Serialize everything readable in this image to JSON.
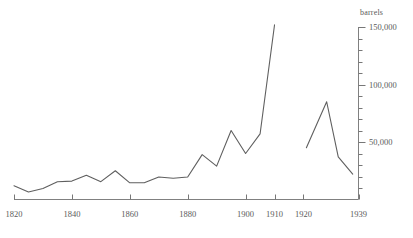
{
  "chart_data": {
    "type": "line",
    "title": "",
    "subtitle": "",
    "xlabel": "",
    "ylabel": "barrels",
    "ylabel_position": "top-right",
    "axis_position": {
      "y_axis": "right",
      "x_axis": "bottom"
    },
    "grid": false,
    "legend": null,
    "xlim": [
      1820,
      1939
    ],
    "ylim": [
      0,
      150000
    ],
    "ytick_major_values": [
      50000,
      100000,
      150000
    ],
    "ytick_major_labels": [
      "50,000",
      "100,000",
      "150,000"
    ],
    "ytick_minor_step": 10000,
    "xtick_values": [
      1820,
      1840,
      1860,
      1880,
      1900,
      1910,
      1920,
      1939
    ],
    "xtick_labels": [
      "1820",
      "1840",
      "1860",
      "1880",
      "1900",
      "1910",
      "1920",
      "1939"
    ],
    "series": [
      {
        "name": "pre-war",
        "color": "#5f5f5f",
        "x": [
          1820,
          1825,
          1830,
          1835,
          1840,
          1845,
          1850,
          1855,
          1860,
          1865,
          1870,
          1875,
          1880,
          1885,
          1890,
          1895,
          1900,
          1905,
          1910
        ],
        "values": [
          12000,
          6500,
          9500,
          15500,
          16000,
          21000,
          15500,
          25000,
          14500,
          14500,
          19500,
          18500,
          19500,
          39000,
          29000,
          60000,
          40000,
          57000,
          152000
        ]
      },
      {
        "name": "post-war",
        "color": "#5f5f5f",
        "x": [
          1921,
          1928,
          1932,
          1937
        ],
        "values": [
          45000,
          85000,
          37000,
          22000
        ]
      }
    ]
  },
  "axis": {
    "y_title": "barrels",
    "y_labels": [
      "150,000",
      "100,000",
      "50,000"
    ],
    "x_labels": [
      "1820",
      "1840",
      "1860",
      "1880",
      "1900",
      "1910",
      "1920",
      "1939"
    ]
  },
  "colors": {
    "line": "#5f5f5f",
    "axis": "#777777",
    "text": "#5a5a5a",
    "background": "#ffffff"
  }
}
